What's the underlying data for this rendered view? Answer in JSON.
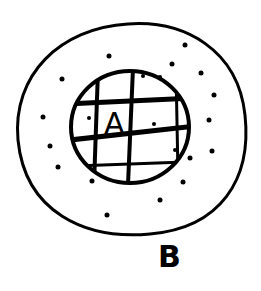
{
  "diagram": {
    "type": "nested-sets",
    "outer_set": {
      "label": "B"
    },
    "inner_set": {
      "label": "A",
      "fill": "grid-hatched"
    },
    "relation": "A is a subset of B",
    "stroke_color": "#000000",
    "background_color": "#ffffff"
  }
}
